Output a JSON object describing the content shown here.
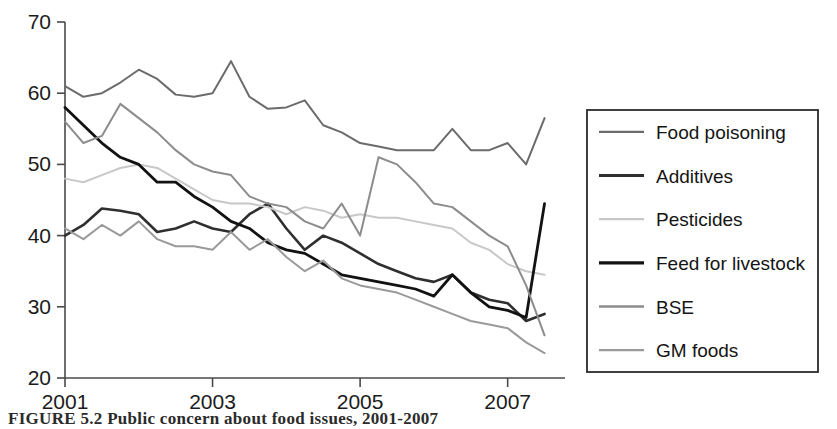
{
  "figure": {
    "caption": "FIGURE 5.2   Public concern about food issues, 2001-2007"
  },
  "chart_data": {
    "type": "line",
    "title": "",
    "xlabel": "",
    "ylabel": "",
    "xlim": [
      2001,
      2007.75
    ],
    "ylim": [
      20,
      70
    ],
    "grid": false,
    "legend_position": "right",
    "xticks": [
      "2001",
      "2003",
      "2005",
      "2007"
    ],
    "xtick_values": [
      2001,
      2003,
      2005,
      2007
    ],
    "yticks": [
      "20",
      "30",
      "40",
      "50",
      "60",
      "70"
    ],
    "ytick_values": [
      20,
      30,
      40,
      50,
      60,
      70
    ],
    "x": [
      2001,
      2001.25,
      2001.5,
      2001.75,
      2002,
      2002.25,
      2002.5,
      2002.75,
      2003,
      2003.25,
      2003.5,
      2003.75,
      2004,
      2004.25,
      2004.5,
      2004.75,
      2005,
      2005.25,
      2005.5,
      2005.75,
      2006,
      2006.25,
      2006.5,
      2006.75,
      2007,
      2007.25,
      2007.5
    ],
    "series": [
      {
        "name": "Food poisoning",
        "color": "#6b6b6b",
        "width": 2.0,
        "values": [
          61.0,
          59.5,
          60.0,
          61.5,
          63.3,
          62.0,
          59.8,
          59.5,
          60.0,
          64.5,
          59.5,
          57.8,
          58.0,
          59.0,
          55.5,
          54.5,
          53.0,
          52.5,
          52.0,
          52.0,
          52.0,
          55.0,
          52.0,
          52.0,
          53.0,
          50.0,
          56.5
        ]
      },
      {
        "name": "Additives",
        "color": "#2f2f2f",
        "width": 2.6,
        "values": [
          40.0,
          41.5,
          43.8,
          43.5,
          43.0,
          40.5,
          41.0,
          42.0,
          41.0,
          40.5,
          43.0,
          44.5,
          41.0,
          38.0,
          40.0,
          39.0,
          37.5,
          36.0,
          35.0,
          34.0,
          33.5,
          34.5,
          32.0,
          31.0,
          30.5,
          28.0,
          29.0
        ]
      },
      {
        "name": "Pesticides",
        "color": "#c8c8c8",
        "width": 2.0,
        "values": [
          48.0,
          47.5,
          48.5,
          49.5,
          50.0,
          49.5,
          48.0,
          46.5,
          45.0,
          44.5,
          44.5,
          44.0,
          43.0,
          44.0,
          43.5,
          42.5,
          43.0,
          42.5,
          42.5,
          42.0,
          41.5,
          41.0,
          39.0,
          38.0,
          36.0,
          35.0,
          34.5
        ]
      },
      {
        "name": "Feed for livestock",
        "color": "#121212",
        "width": 2.8,
        "values": [
          58.0,
          55.5,
          53.0,
          51.0,
          50.0,
          47.5,
          47.5,
          45.5,
          44.0,
          42.0,
          41.0,
          39.0,
          38.0,
          37.5,
          36.0,
          34.5,
          34.0,
          33.5,
          33.0,
          32.5,
          31.5,
          34.5,
          32.0,
          30.0,
          29.5,
          28.5,
          44.5
        ]
      },
      {
        "name": "BSE",
        "color": "#8c8c8c",
        "width": 2.0,
        "values": [
          56.0,
          53.0,
          54.0,
          58.5,
          56.5,
          54.5,
          52.0,
          50.0,
          49.0,
          48.5,
          45.5,
          44.5,
          44.0,
          42.0,
          41.0,
          44.5,
          40.0,
          51.0,
          50.0,
          47.5,
          44.5,
          44.0,
          42.0,
          40.0,
          38.5,
          33.0,
          26.0
        ]
      },
      {
        "name": "GM foods",
        "color": "#9a9a9a",
        "width": 2.0,
        "values": [
          41.0,
          39.5,
          41.5,
          40.0,
          42.0,
          39.5,
          38.5,
          38.5,
          38.0,
          40.5,
          38.0,
          39.5,
          37.0,
          35.0,
          36.5,
          34.0,
          33.0,
          32.5,
          32.0,
          31.0,
          30.0,
          29.0,
          28.0,
          27.5,
          27.0,
          25.0,
          23.5
        ]
      }
    ]
  },
  "legend": {
    "entries": [
      {
        "label": "Food poisoning"
      },
      {
        "label": "Additives"
      },
      {
        "label": "Pesticides"
      },
      {
        "label": "Feed for livestock"
      },
      {
        "label": "BSE"
      },
      {
        "label": "GM foods"
      }
    ]
  }
}
